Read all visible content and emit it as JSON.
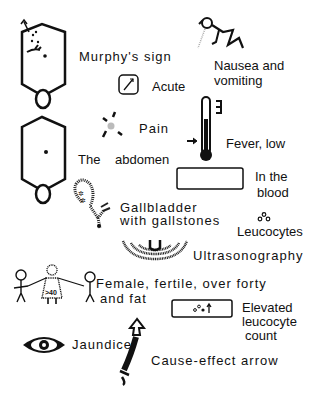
{
  "labels": {
    "murphys_sign": "Murphy's sign",
    "acute": "Acute",
    "nausea_line1": "Nausea and",
    "nausea_line2": "vomiting",
    "pain": "Pain",
    "the": "The",
    "abdomen": "abdomen",
    "fever": "Fever, low",
    "in_the_blood_line1": "In the",
    "in_the_blood_line2": "blood",
    "gallbladder_line1": "Gallbladder",
    "gallbladder_line2": "with gallstones",
    "leucocytes": "Leucocytes",
    "ultrasonography": "Ultrasonography",
    "female_line1": "Female, fertile, over forty",
    "female_line2": "and fat",
    "age_badge": ">40",
    "elevated_line1": "Elevated",
    "elevated_line2": "leucocyte",
    "elevated_line3": "count",
    "jaundice": "Jaundice",
    "cause_effect": "Cause-effect arrow"
  },
  "colors": {
    "ink": "#111111",
    "background": "#ffffff",
    "gray_dot": "#bbbbbb"
  }
}
